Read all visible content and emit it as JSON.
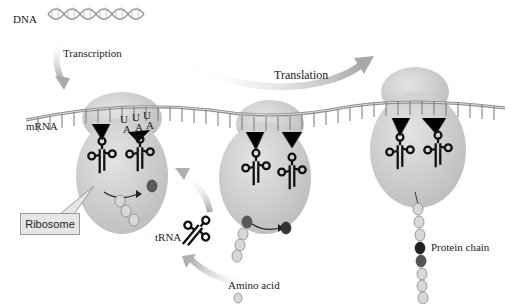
{
  "labels": {
    "dna": "DNA",
    "transcription": "Transcription",
    "translation": "Translation",
    "mrna": "mRNA",
    "ribosome": "Ribosome",
    "trna": "tRNA",
    "amino_acid": "Amino acid",
    "protein_chain": "Protein chain"
  },
  "codons": {
    "top": [
      "U",
      "U",
      "U"
    ],
    "bottom": [
      "A",
      "A",
      "A"
    ]
  },
  "colors": {
    "ribosome": "#c8c8c8",
    "ribosome_light": "#e2e2e2",
    "arrow": "#b4b4b4",
    "amino_acid": "#d8d8d8",
    "amino_acid_dark": "#5a5a5a",
    "mrna": "#9a9a9a",
    "trna": "#111111"
  }
}
